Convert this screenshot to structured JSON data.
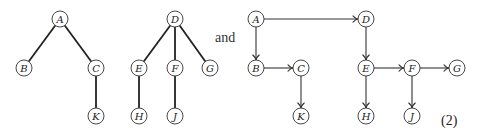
{
  "diagram": {
    "conjunction": "and",
    "equation_number": "(2)",
    "forest": {
      "name": "tree-forest",
      "trees": [
        {
          "root": "A",
          "nodes": [
            "A",
            "B",
            "C",
            "K"
          ],
          "edges": [
            [
              "A",
              "B"
            ],
            [
              "A",
              "C"
            ],
            [
              "C",
              "K"
            ]
          ]
        },
        {
          "root": "D",
          "nodes": [
            "D",
            "E",
            "F",
            "G",
            "H",
            "J"
          ],
          "edges": [
            [
              "D",
              "E"
            ],
            [
              "D",
              "F"
            ],
            [
              "D",
              "G"
            ],
            [
              "E",
              "H"
            ],
            [
              "F",
              "J"
            ]
          ]
        }
      ]
    },
    "binary_representation": {
      "name": "directed-graph",
      "nodes": [
        "A",
        "B",
        "C",
        "K",
        "D",
        "E",
        "F",
        "G",
        "H",
        "J"
      ],
      "edges": [
        {
          "from": "A",
          "to": "D",
          "direction": "right"
        },
        {
          "from": "A",
          "to": "B",
          "direction": "down"
        },
        {
          "from": "B",
          "to": "C",
          "direction": "right"
        },
        {
          "from": "C",
          "to": "K",
          "direction": "down"
        },
        {
          "from": "D",
          "to": "E",
          "direction": "down"
        },
        {
          "from": "E",
          "to": "F",
          "direction": "right"
        },
        {
          "from": "F",
          "to": "G",
          "direction": "right"
        },
        {
          "from": "E",
          "to": "H",
          "direction": "down"
        },
        {
          "from": "F",
          "to": "J",
          "direction": "down"
        }
      ]
    }
  }
}
